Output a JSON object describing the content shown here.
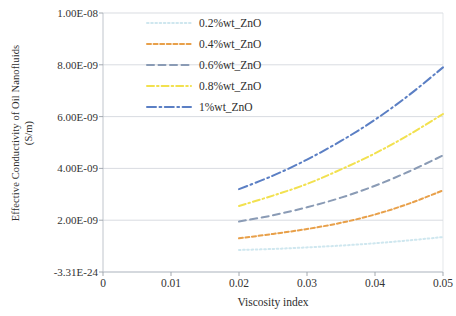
{
  "chart_data": {
    "type": "line",
    "title": "",
    "xlabel": "Viscosity index",
    "ylabel": "Effective Conductivity of Oil Nanofluids\n(S/m)",
    "xlim": [
      0,
      0.05
    ],
    "ylim": [
      0,
      1e-08
    ],
    "grid": true,
    "legend_position": "top-center-inside",
    "xticks": [
      "0",
      "0.01",
      "0.02",
      "0.03",
      "0.04",
      "0.05"
    ],
    "xtick_values": [
      0,
      0.01,
      0.02,
      0.03,
      0.04,
      0.05
    ],
    "yticks": [
      "-3.31E-24",
      "2.00E-09",
      "4.00E-09",
      "6.00E-09",
      "8.00E-09",
      "1.00E-08"
    ],
    "ytick_values": [
      0,
      2e-09,
      4e-09,
      6e-09,
      8e-09,
      1e-08
    ],
    "x": [
      0.02,
      0.025,
      0.03,
      0.035,
      0.04,
      0.045,
      0.05
    ],
    "series": [
      {
        "name": "0.2%wt_ZnO",
        "color": "#cfe7ef",
        "dash": "dotted",
        "values": [
          8.5e-10,
          8.9e-10,
          9.5e-10,
          1.02e-09,
          1.11e-09,
          1.22e-09,
          1.35e-09
        ]
      },
      {
        "name": "0.4%wt_ZnO",
        "color": "#e8a04a",
        "dash": "dashed-short",
        "values": [
          1.3e-09,
          1.47e-09,
          1.66e-09,
          1.9e-09,
          2.22e-09,
          2.64e-09,
          3.15e-09
        ]
      },
      {
        "name": "0.6%wt_ZnO",
        "color": "#8a9bb5",
        "dash": "dashed-long",
        "values": [
          1.95e-09,
          2.19e-09,
          2.5e-09,
          2.87e-09,
          3.33e-09,
          3.88e-09,
          4.5e-09
        ]
      },
      {
        "name": "0.8%wt_ZnO",
        "color": "#f2e14f",
        "dash": "dash-dot",
        "values": [
          2.55e-09,
          2.95e-09,
          3.4e-09,
          3.96e-09,
          4.58e-09,
          5.3e-09,
          6.1e-09
        ]
      },
      {
        "name": "1%wt_ZnO",
        "color": "#5b7fc4",
        "dash": "dash-dot-long",
        "values": [
          3.2e-09,
          3.72e-09,
          4.34e-09,
          5.06e-09,
          5.88e-09,
          6.83e-09,
          7.9e-09
        ]
      }
    ]
  },
  "axes": {
    "y_title": "Effective Conductivity of  Oil Nanofluids\n(S/m)",
    "x_title": "Viscosity index"
  },
  "legend": {
    "items": [
      {
        "label": "0.2%wt_ZnO"
      },
      {
        "label": "0.4%wt_ZnO"
      },
      {
        "label": "0.6%wt_ZnO"
      },
      {
        "label": "0.8%wt_ZnO"
      },
      {
        "label": "1%wt_ZnO"
      }
    ]
  },
  "ticks": {
    "y": [
      {
        "label": "1.00E-08"
      },
      {
        "label": "8.00E-09"
      },
      {
        "label": "6.00E-09"
      },
      {
        "label": "4.00E-09"
      },
      {
        "label": "2.00E-09"
      },
      {
        "label": "-3.31E-24"
      }
    ],
    "x": [
      {
        "label": "0"
      },
      {
        "label": "0.01"
      },
      {
        "label": "0.02"
      },
      {
        "label": "0.03"
      },
      {
        "label": "0.04"
      },
      {
        "label": "0.05"
      }
    ]
  }
}
